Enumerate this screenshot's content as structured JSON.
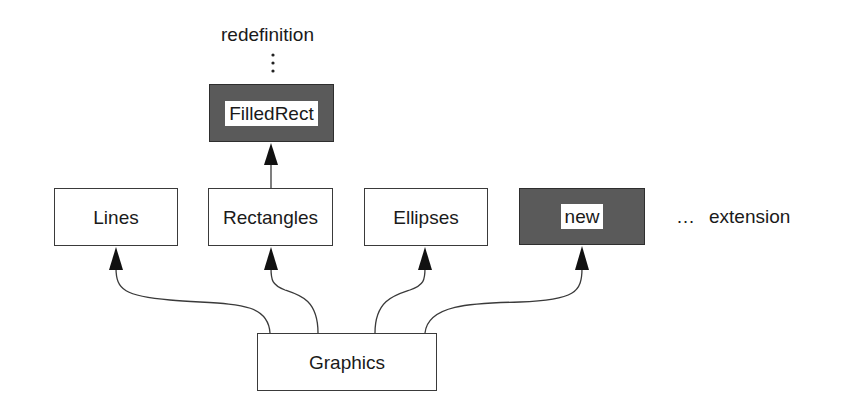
{
  "diagram": {
    "annotations": {
      "redefinition": "redefinition",
      "extension_ellipsis": "…",
      "extension": "extension"
    },
    "nodes": [
      {
        "id": "filledrect",
        "label": "FilledRect",
        "style": "shaded"
      },
      {
        "id": "lines",
        "label": "Lines",
        "style": "plain"
      },
      {
        "id": "rectangles",
        "label": "Rectangles",
        "style": "plain"
      },
      {
        "id": "ellipses",
        "label": "Ellipses",
        "style": "plain"
      },
      {
        "id": "new",
        "label": "new",
        "style": "shaded"
      },
      {
        "id": "graphics",
        "label": "Graphics",
        "style": "plain"
      }
    ],
    "edges": [
      {
        "from": "graphics",
        "to": "lines"
      },
      {
        "from": "graphics",
        "to": "rectangles"
      },
      {
        "from": "graphics",
        "to": "ellipses"
      },
      {
        "from": "graphics",
        "to": "new"
      },
      {
        "from": "rectangles",
        "to": "filledrect"
      },
      {
        "from": "filledrect",
        "to": "redefinition",
        "style": "dotted"
      }
    ],
    "colors": {
      "stroke": "#3a3a3a",
      "shaded_fill": "#5a5a5a",
      "plain_fill": "#ffffff",
      "text": "#1a1a1a"
    }
  }
}
